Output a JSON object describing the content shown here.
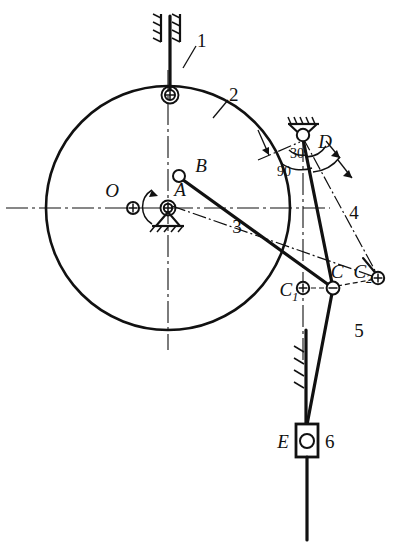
{
  "diagram": {
    "type": "mechanism-schematic",
    "colors": {
      "ink": "#111111",
      "paper": "#ffffff"
    },
    "point_labels": {
      "O": "O",
      "A": "A",
      "B": "B",
      "C": "C",
      "C1_base": "C",
      "C1_sub": "1",
      "C2_base": "C",
      "C2_sub": "2",
      "D": "D",
      "E": "E"
    },
    "link_numbers": {
      "link1": "1",
      "link2": "2",
      "link3": "3",
      "link4": "4",
      "link5": "5",
      "link6": "6"
    },
    "angles": {
      "angle_30": "30",
      "angle_90": "90"
    },
    "geometry": {
      "circle_center": [
        168,
        208
      ],
      "circle_radius": 122,
      "point_O": [
        133,
        208
      ],
      "point_A": [
        168,
        208
      ],
      "point_B": [
        179,
        177
      ],
      "point_top_pivot": [
        170,
        95
      ],
      "point_D": [
        303,
        135
      ],
      "point_C": [
        333,
        288
      ],
      "point_C1": [
        303,
        288
      ],
      "point_C2": [
        378,
        278
      ],
      "point_E": [
        306,
        441
      ]
    }
  }
}
